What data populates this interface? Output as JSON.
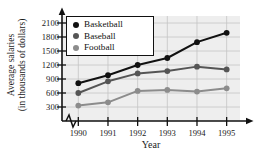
{
  "chart_data": {
    "type": "line",
    "title": "",
    "xlabel": "Year",
    "ylabel_line1": "Average salaries",
    "ylabel_line2": "(in thousands of dollars)",
    "categories": [
      "1990",
      "1991",
      "1992",
      "1993",
      "1994",
      "1995"
    ],
    "x": [
      1990,
      1991,
      1992,
      1993,
      1994,
      1995
    ],
    "xlim": [
      1990,
      1995
    ],
    "ylim": [
      0,
      2250
    ],
    "yticks": [
      300,
      600,
      900,
      1200,
      1500,
      1800,
      2100
    ],
    "ytick_labels": [
      "300",
      "600",
      "900",
      "1200",
      "1500",
      "1800",
      "2100"
    ],
    "grid": true,
    "legend_position": "upper-left",
    "axis_break_x": true,
    "series": [
      {
        "name": "Basketball",
        "color": "#111111",
        "values": [
          810,
          980,
          1200,
          1350,
          1690,
          1890
        ]
      },
      {
        "name": "Baseball",
        "color": "#555555",
        "values": [
          600,
          850,
          1020,
          1070,
          1165,
          1105
        ]
      },
      {
        "name": "Football",
        "color": "#8c8c8c",
        "values": [
          330,
          400,
          645,
          665,
          630,
          700
        ]
      }
    ]
  },
  "legend": {
    "items": [
      {
        "label": "Basketball",
        "color": "#111111"
      },
      {
        "label": "Baseball",
        "color": "#555555"
      },
      {
        "label": "Football",
        "color": "#8c8c8c"
      }
    ]
  },
  "axes": {
    "x_title": "Year",
    "y_title_line1": "Average salaries",
    "y_title_line2": "(in thousands of dollars)",
    "x_tick_labels": [
      "1990",
      "1991",
      "1992",
      "1993",
      "1994",
      "1995"
    ],
    "y_tick_labels": [
      "2100",
      "1800",
      "1500",
      "1200",
      "900",
      "600",
      "300"
    ]
  },
  "colors": {
    "plot_background": "#eeeeee",
    "grid": "#c4c4c4",
    "axis": "#111111",
    "text": "#1a1a1a"
  }
}
